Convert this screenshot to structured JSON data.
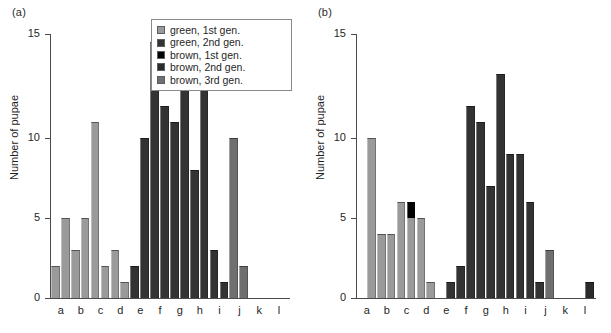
{
  "figure": {
    "panels": [
      {
        "id": "a",
        "label": "(a)",
        "ylabel": "Number of pupae"
      },
      {
        "id": "b",
        "label": "(b)",
        "ylabel": "Number of pupae"
      }
    ]
  },
  "legend": {
    "position": "top-right of panel a",
    "items": [
      {
        "label": "green, 1st gen.",
        "color": "#9a9a9a",
        "key": "green1"
      },
      {
        "label": "green, 2nd gen.",
        "color": "#333333",
        "key": "green2"
      },
      {
        "label": "brown, 1st gen.",
        "color": "#000000",
        "key": "brown1"
      },
      {
        "label": "brown, 2nd gen.",
        "color": "#2b2b2b",
        "key": "brown2"
      },
      {
        "label": "brown, 3rd gen.",
        "color": "#6f6f6f",
        "key": "brown3"
      }
    ]
  },
  "chart_data": [
    {
      "type": "bar",
      "title": "(a)",
      "xlabel": "",
      "ylabel": "Number of pupae",
      "ylim": [
        0,
        16.5
      ],
      "yticks": [
        0,
        5,
        10,
        15
      ],
      "ytick_labels": [
        "0",
        "5",
        "10",
        "15"
      ],
      "grid": false,
      "categories": [
        "a",
        "b",
        "c",
        "d",
        "e",
        "f",
        "g",
        "h",
        "i",
        "j",
        "k",
        "l"
      ],
      "bars_per_category": 2,
      "series": [
        {
          "name": "green, 1st gen.",
          "color": "#9a9a9a",
          "values": [
            2,
            5,
            3,
            5,
            11,
            2,
            3,
            1,
            0,
            0,
            0,
            0,
            0,
            0,
            0,
            0,
            0,
            0,
            0,
            0,
            0,
            0,
            0,
            0
          ]
        },
        {
          "name": "green, 2nd gen.",
          "color": "#333333",
          "values": [
            0,
            0,
            0,
            0,
            0,
            0,
            0,
            0,
            2,
            10,
            16,
            12,
            11,
            15,
            8,
            15,
            3,
            1,
            0,
            0,
            0,
            0,
            0,
            0
          ]
        },
        {
          "name": "brown, 1st gen.",
          "color": "#000000",
          "values": [
            0,
            0,
            0,
            0,
            0,
            0,
            0,
            0,
            0,
            0,
            0,
            0,
            0,
            0,
            0,
            0,
            0,
            0,
            0,
            0,
            0,
            0,
            0,
            0
          ]
        },
        {
          "name": "brown, 2nd gen.",
          "color": "#2b2b2b",
          "values": [
            0,
            0,
            0,
            0,
            0,
            0,
            0,
            0,
            0,
            0,
            0,
            0,
            0,
            0,
            0,
            0,
            0,
            0,
            0,
            0,
            0,
            0,
            0,
            0
          ]
        },
        {
          "name": "brown, 3rd gen.",
          "color": "#6f6f6f",
          "values": [
            0,
            0,
            0,
            0,
            0,
            0,
            0,
            0,
            0,
            0,
            0,
            0,
            0,
            0,
            0,
            0,
            0,
            0,
            10,
            2,
            0,
            0,
            0,
            0
          ]
        }
      ],
      "bar_totals": [
        2,
        5,
        3,
        5,
        11,
        2,
        3,
        1,
        2,
        10,
        16,
        12,
        11,
        15,
        8,
        15,
        3,
        1,
        10,
        2,
        0,
        0,
        0,
        0
      ]
    },
    {
      "type": "bar",
      "title": "(b)",
      "xlabel": "",
      "ylabel": "Number of pupae",
      "ylim": [
        0,
        16.5
      ],
      "yticks": [
        0,
        5,
        10,
        15
      ],
      "ytick_labels": [
        "0",
        "5",
        "10",
        "15"
      ],
      "grid": false,
      "categories": [
        "a",
        "b",
        "c",
        "d",
        "e",
        "f",
        "g",
        "h",
        "i",
        "j",
        "k",
        "l"
      ],
      "bars_per_category": 2,
      "series": [
        {
          "name": "green, 1st gen.",
          "color": "#9a9a9a",
          "values": [
            0,
            10,
            4,
            4,
            6,
            5,
            5,
            1,
            0,
            0,
            0,
            0,
            0,
            0,
            0,
            0,
            0,
            0,
            0,
            0,
            0,
            0,
            0,
            0
          ]
        },
        {
          "name": "green, 2nd gen.",
          "color": "#333333",
          "values": [
            0,
            0,
            0,
            0,
            0,
            0,
            0,
            0,
            0,
            1,
            2,
            12,
            11,
            7,
            14,
            9,
            9,
            6,
            1,
            0,
            0,
            0,
            0,
            0
          ]
        },
        {
          "name": "brown, 1st gen.",
          "color": "#000000",
          "values": [
            0,
            0,
            0,
            0,
            0,
            1,
            0,
            0,
            0,
            0,
            0,
            0,
            0,
            0,
            0,
            0,
            0,
            0,
            0,
            0,
            0,
            0,
            0,
            0
          ]
        },
        {
          "name": "brown, 2nd gen.",
          "color": "#2b2b2b",
          "values": [
            0,
            0,
            0,
            0,
            0,
            0,
            0,
            0,
            0,
            0,
            0,
            0,
            0,
            0,
            0,
            0,
            0,
            0,
            0,
            0,
            0,
            0,
            0,
            1
          ]
        },
        {
          "name": "brown, 3rd gen.",
          "color": "#6f6f6f",
          "values": [
            0,
            0,
            0,
            0,
            0,
            0,
            0,
            0,
            0,
            0,
            0,
            0,
            0,
            0,
            0,
            0,
            0,
            0,
            0,
            3,
            0,
            0,
            0,
            0
          ]
        }
      ],
      "bar_totals": [
        0,
        10,
        4,
        4,
        6,
        6,
        5,
        1,
        0,
        1,
        2,
        12,
        11,
        7,
        14,
        9,
        9,
        6,
        1,
        3,
        0,
        0,
        0,
        1
      ]
    }
  ]
}
